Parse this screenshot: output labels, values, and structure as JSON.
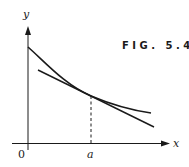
{
  "figure": {
    "caption": "FIG. 5.4",
    "labels": {
      "y_axis": "y",
      "x_axis": "x",
      "origin": "0",
      "point": "a"
    },
    "colors": {
      "stroke": "#1a1a1a",
      "background": "#ffffff"
    }
  }
}
